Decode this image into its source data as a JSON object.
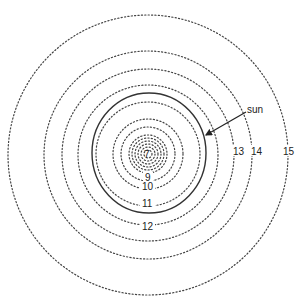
{
  "diagram": {
    "type": "concentric-contours",
    "center": {
      "x": 148,
      "y": 154
    },
    "rings": [
      {
        "label": "",
        "r": 4
      },
      {
        "label": "",
        "r": 7
      },
      {
        "label": "",
        "r": 10
      },
      {
        "label": "",
        "r": 13
      },
      {
        "label": "",
        "r": 16
      },
      {
        "label": "",
        "r": 19
      },
      {
        "label": "9",
        "r": 27
      },
      {
        "label": "10",
        "r": 35
      },
      {
        "label": "11",
        "r": 52
      },
      {
        "label": "12",
        "r": 70
      },
      {
        "label": "13",
        "r": 86
      },
      {
        "label": "14",
        "r": 104
      },
      {
        "label": "15",
        "r": 140
      }
    ],
    "center_label": "7",
    "sun": {
      "label": "sun",
      "cx": 149,
      "cy": 153,
      "rx": 57,
      "ry": 60
    },
    "labels": {
      "l7": "7",
      "l9": "9",
      "l10": "10",
      "l11": "11",
      "l12": "12",
      "l13": "13",
      "l14": "14",
      "l15": "15",
      "sun": "sun"
    }
  }
}
